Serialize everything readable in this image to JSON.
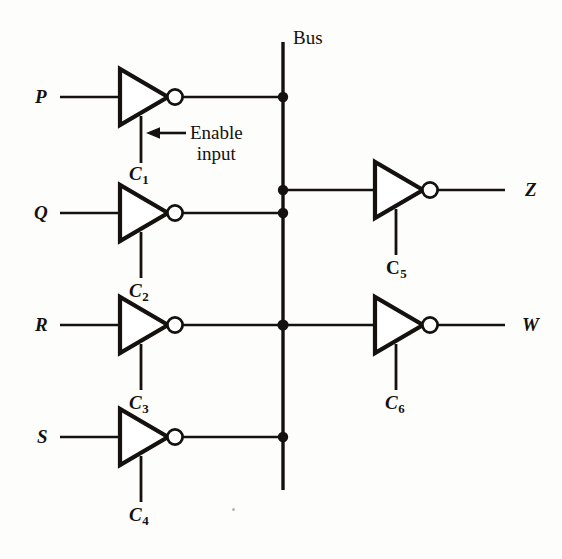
{
  "figure": {
    "kind": "logic-circuit-schematic",
    "title_visible": false,
    "bus_label": "Bus",
    "annotation": {
      "line1": "Enable",
      "line2": "input",
      "arrow": "left-arrow",
      "points_to": "C1"
    },
    "ink_color": "#14110f",
    "paper_color": "#fdfdfb"
  },
  "inputs": [
    {
      "label": "P",
      "control": "C",
      "control_sub": "1",
      "y": 97
    },
    {
      "label": "Q",
      "control": "C",
      "control_sub": "2",
      "y": 213
    },
    {
      "label": "R",
      "control": "C",
      "control_sub": "3",
      "y": 325
    },
    {
      "label": "S",
      "control": "C",
      "control_sub": "4",
      "y": 437
    }
  ],
  "outputs": [
    {
      "label": "Z",
      "control": "C",
      "control_sub": "5",
      "y": 190
    },
    {
      "label": "W",
      "control": "C",
      "control_sub": "6",
      "y": 325
    }
  ],
  "bus": {
    "label": "Bus",
    "x": 283,
    "y_top": 42,
    "y_bottom": 490,
    "junction_count": 5,
    "junctions_y": [
      97,
      190,
      213,
      325,
      437
    ]
  },
  "gate_type": "tri-state inverting buffer",
  "gate_count": 6
}
